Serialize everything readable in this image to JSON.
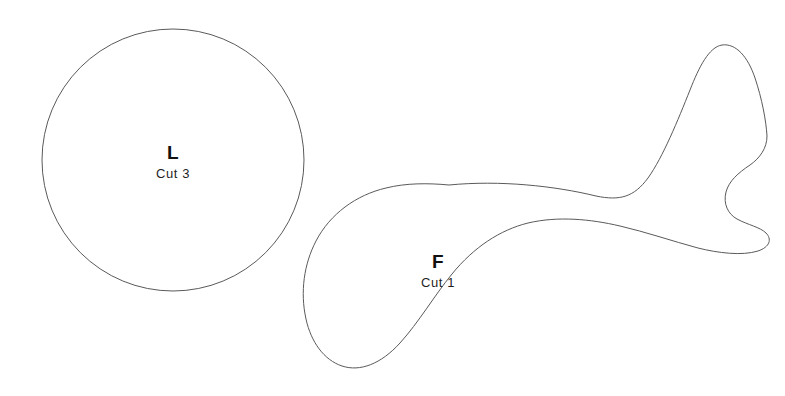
{
  "document": {
    "title": "Sewing Pattern Template Sheet",
    "background_color": "#ffffff",
    "outline_color": "#5a5a5a",
    "text_color": "#111111",
    "width": 785,
    "height": 396
  },
  "pieces": [
    {
      "id": "piece-l",
      "letter": "L",
      "cut_label": "Cut 3",
      "shape": "circle",
      "description": "large plain circle",
      "center_x": 173,
      "center_y": 160,
      "radius": 131
    },
    {
      "id": "piece-f",
      "letter": "F",
      "cut_label": "Cut 1",
      "shape": "freeform",
      "description": "organic whale or fish shaped piece with rounded body on the left and a forked tail on the right",
      "bounds": {
        "left": 303,
        "top": 44,
        "right": 771,
        "bottom": 367
      }
    }
  ]
}
